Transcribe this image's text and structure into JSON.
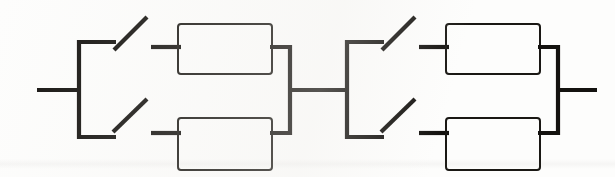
{
  "document": {
    "title": "Reliability block diagram",
    "background_color": "#fdfdfc",
    "ink_color": "#14120f",
    "canvas": {
      "width": 615,
      "height": 177
    }
  },
  "diagram": {
    "type": "reliability-block-diagram",
    "stroke_widths": {
      "wire": 4.2,
      "block": 2.0
    },
    "leads": [
      {
        "name": "input-lead",
        "x1": 37,
        "y1": 90,
        "x2": 81,
        "y2": 90
      },
      {
        "name": "interstage-lead",
        "x1": 288,
        "y1": 90,
        "x2": 349,
        "y2": 90
      },
      {
        "name": "output-lead",
        "x1": 556,
        "y1": 90,
        "x2": 597,
        "y2": 90
      }
    ],
    "stages": [
      {
        "name": "stage-1",
        "switch_bus": {
          "x": 79,
          "y_top": 42,
          "y_bottom": 137
        },
        "switches": [
          {
            "name": "switch-1-top",
            "state": "open",
            "pole_lead": {
              "x1": 79,
              "y1": 42,
              "x2": 116,
              "y2": 42
            },
            "blade": {
              "x1": 114,
              "y1": 50,
              "x2": 146,
              "y2": 18
            },
            "contact_lead": {
              "x1": 152,
              "y1": 47,
              "x2": 180,
              "y2": 47
            }
          },
          {
            "name": "switch-1-bottom",
            "state": "open",
            "pole_lead": {
              "x1": 79,
              "y1": 137,
              "x2": 116,
              "y2": 137
            },
            "blade": {
              "x1": 114,
              "y1": 131,
              "x2": 146,
              "y2": 100
            },
            "contact_lead": {
              "x1": 152,
              "y1": 133,
              "x2": 180,
              "y2": 133
            }
          }
        ],
        "blocks": [
          {
            "name": "block-1-top",
            "x": 178,
            "y": 24,
            "width": 94,
            "height": 50
          },
          {
            "name": "block-1-bottom",
            "x": 178,
            "y": 118,
            "width": 94,
            "height": 52
          }
        ],
        "merge_bus": {
          "x": 290,
          "y_top": 47,
          "y_bottom": 133
        },
        "merge_leads": [
          {
            "name": "merge-1-top",
            "x1": 271,
            "y1": 47,
            "x2": 292,
            "y2": 47
          },
          {
            "name": "merge-1-bottom",
            "x1": 271,
            "y1": 133,
            "x2": 292,
            "y2": 133
          }
        ]
      },
      {
        "name": "stage-2",
        "switch_bus": {
          "x": 347,
          "y_top": 42,
          "y_bottom": 137
        },
        "switches": [
          {
            "name": "switch-2-top",
            "state": "open",
            "pole_lead": {
              "x1": 347,
              "y1": 42,
              "x2": 384,
              "y2": 42
            },
            "blade": {
              "x1": 382,
              "y1": 50,
              "x2": 414,
              "y2": 18
            },
            "contact_lead": {
              "x1": 420,
              "y1": 47,
              "x2": 448,
              "y2": 47
            }
          },
          {
            "name": "switch-2-bottom",
            "state": "open",
            "pole_lead": {
              "x1": 347,
              "y1": 137,
              "x2": 384,
              "y2": 137
            },
            "blade": {
              "x1": 382,
              "y1": 131,
              "x2": 414,
              "y2": 100
            },
            "contact_lead": {
              "x1": 420,
              "y1": 133,
              "x2": 448,
              "y2": 133
            }
          }
        ],
        "blocks": [
          {
            "name": "block-2-top",
            "x": 446,
            "y": 24,
            "width": 94,
            "height": 50
          },
          {
            "name": "block-2-bottom",
            "x": 446,
            "y": 118,
            "width": 94,
            "height": 52
          }
        ],
        "merge_bus": {
          "x": 558,
          "y_top": 47,
          "y_bottom": 133
        },
        "merge_leads": [
          {
            "name": "merge-2-top",
            "x1": 539,
            "y1": 47,
            "x2": 560,
            "y2": 47
          },
          {
            "name": "merge-2-bottom",
            "x1": 539,
            "y1": 133,
            "x2": 560,
            "y2": 133
          }
        ]
      }
    ]
  }
}
